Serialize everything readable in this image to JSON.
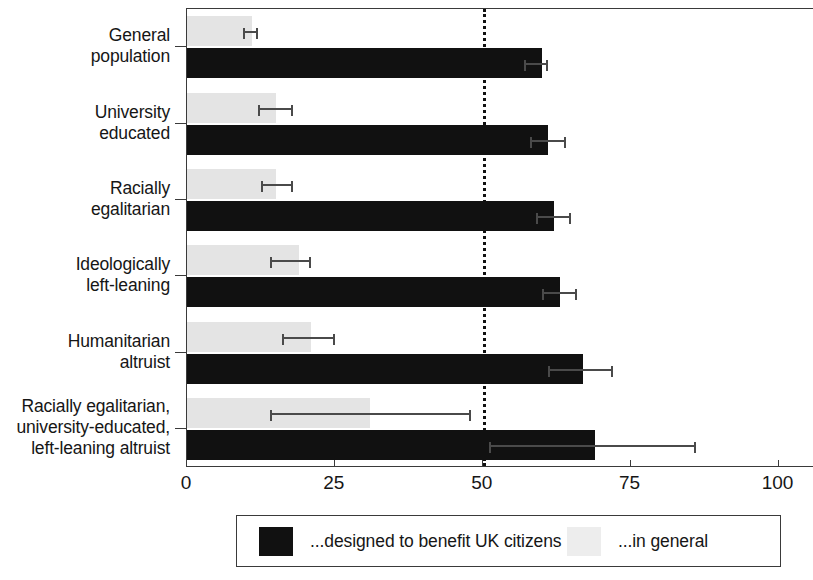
{
  "chart_data": {
    "type": "bar",
    "orientation": "horizontal",
    "title": "",
    "xlabel": "",
    "ylabel": "",
    "xlim": [
      0,
      106
    ],
    "xticks": [
      0,
      25,
      50,
      75,
      100
    ],
    "xtick_labels": [
      "0",
      "25",
      "50",
      "75",
      "100"
    ],
    "grid": false,
    "reference_line": {
      "value": 50,
      "style": "dotted",
      "color": "#111111"
    },
    "legend": {
      "position": "bottom",
      "entries": [
        {
          "label": "...designed to benefit UK citizens",
          "color": "#111111",
          "key": "uk_citizens"
        },
        {
          "label": "...in general",
          "color": "#ededed",
          "key": "in_general"
        }
      ]
    },
    "categories": [
      "General\npopulation",
      "University\neducated",
      "Racially\negalitarian",
      "Ideologically\nleft-leaning",
      "Humanitarian\naltruist",
      "Racially egalitarian,\nuniversity-educated,\nleft-leaning altruist"
    ],
    "series": [
      {
        "name": "...designed to benefit UK citizens",
        "key": "uk_citizens",
        "color": "#111111",
        "values": [
          60,
          61,
          62,
          63,
          67,
          69
        ],
        "ci_low": [
          57,
          58,
          59,
          60,
          61,
          51
        ],
        "ci_high": [
          61,
          64,
          65,
          66,
          72,
          86
        ]
      },
      {
        "name": "...in general",
        "key": "in_general",
        "color": "#ededed",
        "values": [
          11,
          15,
          15,
          19,
          21,
          31
        ],
        "ci_low": [
          9.5,
          12,
          12.5,
          14,
          16,
          14
        ],
        "ci_high": [
          12,
          18,
          18,
          21,
          25,
          48
        ]
      }
    ]
  },
  "axis": {
    "tick_labels": [
      "0",
      "25",
      "50",
      "75",
      "100"
    ]
  },
  "categories": [
    {
      "lines": [
        "General",
        "population"
      ]
    },
    {
      "lines": [
        "University",
        "educated"
      ]
    },
    {
      "lines": [
        "Racially",
        "egalitarian"
      ]
    },
    {
      "lines": [
        "Ideologically",
        "left-leaning"
      ]
    },
    {
      "lines": [
        "Humanitarian",
        "altruist"
      ]
    },
    {
      "lines": [
        "Racially egalitarian,",
        "university-educated,",
        "left-leaning altruist"
      ]
    }
  ],
  "legend": {
    "dark_label": "...designed to benefit UK citizens",
    "light_label": "...in general"
  }
}
